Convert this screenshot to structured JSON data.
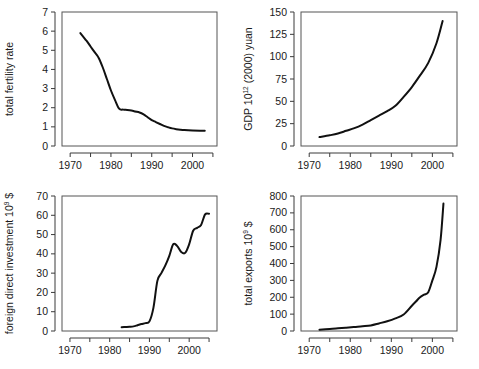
{
  "figure": {
    "background": "#ffffff",
    "line_color": "#111111",
    "axis_color": "#3a3a3a",
    "panel_count": 4
  },
  "chart_data": [
    {
      "id": "total-fertility-rate",
      "type": "line",
      "title": "",
      "xlabel": "",
      "ylabel": "total fertility rate",
      "ylabel_sup": "",
      "xlim": [
        1968,
        2006
      ],
      "ylim": [
        0,
        7
      ],
      "xticks": [
        1970,
        1975,
        1980,
        1985,
        1990,
        1995,
        2000,
        2005
      ],
      "xticklabels": [
        "1970",
        "",
        "1980",
        "",
        "1990",
        "",
        "2000",
        ""
      ],
      "yticks": [
        0,
        1,
        2,
        3,
        4,
        5,
        6,
        7
      ],
      "yticklabels": [
        "0",
        "1",
        "2",
        "3",
        "4",
        "5",
        "6",
        "7"
      ],
      "grid": false,
      "legend": "none",
      "x": [
        1972.5,
        1974,
        1975,
        1976,
        1977,
        1978,
        1979,
        1980,
        1981,
        1982,
        1983,
        1984,
        1985,
        1986,
        1987,
        1988,
        1989,
        1990,
        1991,
        1992,
        1993,
        1994,
        1995,
        1996,
        1997,
        1998,
        2000,
        2002,
        2003
      ],
      "values": [
        5.9,
        5.5,
        5.2,
        4.9,
        4.6,
        4.1,
        3.5,
        2.9,
        2.4,
        1.95,
        1.9,
        1.88,
        1.85,
        1.8,
        1.75,
        1.65,
        1.5,
        1.35,
        1.25,
        1.15,
        1.05,
        0.98,
        0.92,
        0.88,
        0.85,
        0.83,
        0.81,
        0.8,
        0.8
      ]
    },
    {
      "id": "gdp",
      "type": "line",
      "title": "",
      "xlabel": "",
      "ylabel": "GDP 10",
      "ylabel_sup": "12",
      "ylabel_tail": " (2000) yuan",
      "xlim": [
        1968,
        2006
      ],
      "ylim": [
        0,
        150
      ],
      "xticks": [
        1970,
        1975,
        1980,
        1985,
        1990,
        1995,
        2000,
        2005
      ],
      "xticklabels": [
        "1970",
        "",
        "1980",
        "",
        "1990",
        "",
        "2000",
        ""
      ],
      "yticks": [
        0,
        25,
        50,
        75,
        100,
        125,
        150
      ],
      "yticklabels": [
        "0",
        "25",
        "50",
        "75",
        "100",
        "125",
        "150"
      ],
      "grid": false,
      "legend": "none",
      "x": [
        1972.5,
        1975,
        1977,
        1979,
        1981,
        1983,
        1985,
        1987,
        1989,
        1991,
        1993,
        1995,
        1997,
        1999,
        2001,
        2002.5
      ],
      "values": [
        10,
        12,
        14,
        17,
        20,
        24,
        29,
        34,
        39,
        45,
        55,
        66,
        79,
        93,
        115,
        140
      ]
    },
    {
      "id": "foreign-direct-investment",
      "type": "line",
      "title": "",
      "xlabel": "",
      "ylabel": "foreign direct investment 10",
      "ylabel_sup": "9",
      "ylabel_tail": " $",
      "xlim": [
        1968,
        2007
      ],
      "ylim": [
        0,
        70
      ],
      "xticks": [
        1970,
        1975,
        1980,
        1985,
        1990,
        1995,
        2000,
        2005
      ],
      "xticklabels": [
        "1970",
        "",
        "1980",
        "",
        "1990",
        "",
        "2000",
        ""
      ],
      "yticks": [
        0,
        10,
        20,
        30,
        40,
        50,
        60,
        70
      ],
      "yticklabels": [
        "0",
        "10",
        "20",
        "30",
        "40",
        "50",
        "60",
        "70"
      ],
      "grid": false,
      "legend": "none",
      "x": [
        1983,
        1984,
        1985,
        1986,
        1987,
        1988,
        1989,
        1990,
        1991,
        1992,
        1993,
        1994,
        1995,
        1996,
        1997,
        1998,
        1999,
        2000,
        2001,
        2002,
        2003,
        2004,
        2005
      ],
      "values": [
        2.0,
        2.1,
        2.2,
        2.4,
        3.0,
        3.6,
        4.1,
        5.0,
        12.0,
        26.0,
        30.0,
        34.0,
        39.0,
        45.0,
        44.0,
        41.0,
        40.5,
        45.0,
        52.0,
        53.5,
        55.0,
        60.5,
        60.8
      ]
    },
    {
      "id": "total-exports",
      "type": "line",
      "title": "",
      "xlabel": "",
      "ylabel": "total exports 10",
      "ylabel_sup": "9",
      "ylabel_tail": " $",
      "xlim": [
        1968,
        2006
      ],
      "ylim": [
        0,
        800
      ],
      "xticks": [
        1970,
        1975,
        1980,
        1985,
        1990,
        1995,
        2000,
        2005
      ],
      "xticklabels": [
        "1970",
        "",
        "1980",
        "",
        "1990",
        "",
        "2000",
        ""
      ],
      "yticks": [
        0,
        100,
        200,
        300,
        400,
        500,
        600,
        700,
        800
      ],
      "yticklabels": [
        "0",
        "100",
        "200",
        "300",
        "400",
        "500",
        "600",
        "700",
        "800"
      ],
      "grid": false,
      "legend": "none",
      "x": [
        1972.5,
        1975,
        1977,
        1979,
        1981,
        1983,
        1985,
        1987,
        1989,
        1991,
        1993,
        1995,
        1996,
        1997,
        1998,
        1999,
        2000,
        2001,
        2002,
        2002.7
      ],
      "values": [
        8,
        12,
        16,
        20,
        24,
        28,
        33,
        45,
        58,
        75,
        98,
        150,
        175,
        200,
        215,
        230,
        300,
        380,
        540,
        755
      ]
    }
  ]
}
